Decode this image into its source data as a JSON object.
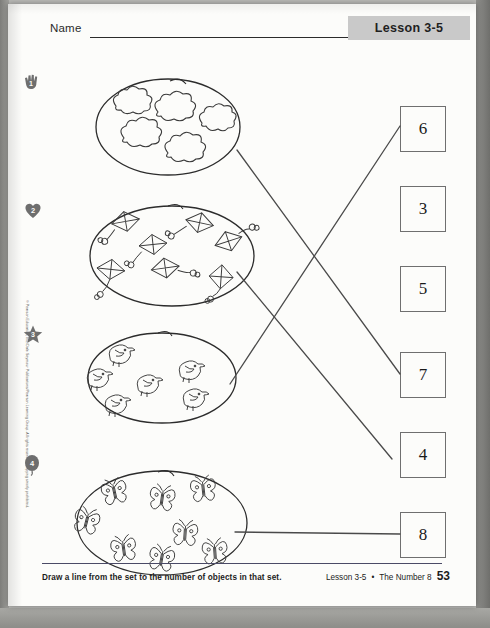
{
  "header": {
    "name_label": "Name",
    "lesson_tab": "Lesson 3-5"
  },
  "copyright": "© Pearson Education, Inc./Dale Seymour Publications/Pearson Learning Group. All rights reserved. Copying strictly prohibited.",
  "instruction": "Draw a line from the set to the number of objects in that set.",
  "footer": {
    "lesson": "Lesson 3-5",
    "separator": "•",
    "topic": "The Number 8",
    "page_number": "53"
  },
  "sets": [
    {
      "number": "1",
      "marker_icon": "hand-icon",
      "object": "cloud",
      "count": 5
    },
    {
      "number": "2",
      "marker_icon": "heart-icon",
      "object": "kite",
      "count": 7
    },
    {
      "number": "3",
      "marker_icon": "star-icon",
      "object": "bird",
      "count": 6
    },
    {
      "number": "4",
      "marker_icon": "balloon-icon",
      "object": "butterfly",
      "count": 8
    }
  ],
  "number_boxes": [
    {
      "value": "6"
    },
    {
      "value": "3"
    },
    {
      "value": "5"
    },
    {
      "value": "7"
    },
    {
      "value": "4"
    },
    {
      "value": "8"
    }
  ],
  "answer_lines": [
    {
      "from_set": "1",
      "to_box": "7"
    },
    {
      "from_set": "2",
      "to_box": "7"
    },
    {
      "from_set": "3",
      "to_box": "6"
    },
    {
      "from_set": "4",
      "to_box": "8"
    }
  ],
  "colors": {
    "paper": "#fcfcfa",
    "ink": "#1a1a1a",
    "tab_bg": "#c9c9c9",
    "box_border": "#6f6f6f",
    "rule": "#4a4a66"
  }
}
